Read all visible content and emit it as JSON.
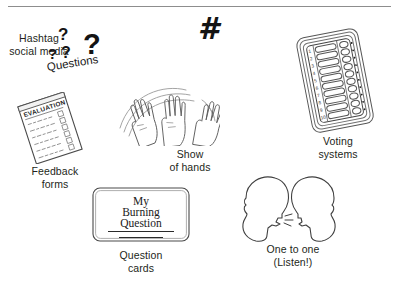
{
  "page": {
    "background_color": "#ffffff",
    "ink_color": "#231f20",
    "width": 398,
    "height": 287
  },
  "divider": {
    "name": "top-horizontal-rule",
    "color": "#8d8d8d"
  },
  "items": [
    {
      "id": "questions",
      "icon": "question-marks-icon",
      "caption": "Questions",
      "marks": {
        "big": "?",
        "mid": "?",
        "small_1": "?",
        "small_2": "?"
      }
    },
    {
      "id": "hashtag",
      "icon": "hashtag-icon",
      "glyph": "#",
      "caption": "Hashtag\nsocial media"
    },
    {
      "id": "voting",
      "icon": "ballot-card-icon",
      "caption": "Voting\nsystems",
      "row_numbers": [
        "1",
        "2",
        "3",
        "4",
        "5",
        "6",
        "7",
        "8",
        "9",
        "10"
      ]
    },
    {
      "id": "hands",
      "icon": "raised-hands-icon",
      "caption": "Show\nof hands"
    },
    {
      "id": "feedback-forms",
      "icon": "evaluation-form-icon",
      "caption": "Feedback\nforms",
      "form_heading": "EVALUATION"
    },
    {
      "id": "question-cards",
      "icon": "index-card-icon",
      "caption": "Question\ncards",
      "card_text_line_1": "My",
      "card_text_line_2": "Burning",
      "card_text_line_3": "Question"
    },
    {
      "id": "one-to-one",
      "icon": "two-head-profiles-icon",
      "caption": "One to one\n(Listen!)"
    }
  ]
}
